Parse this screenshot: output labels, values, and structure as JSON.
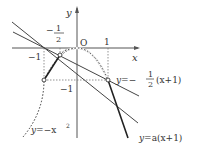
{
  "diagram": {
    "axes": {
      "x_label": "x",
      "y_label": "y",
      "origin_label": "O"
    },
    "ticks": {
      "x_neg_one": "−1",
      "x_neg_half_num": "1",
      "x_neg_half_den": "2",
      "x_neg_half_sign": "−",
      "x_one": "1",
      "y_neg_one": "−1"
    },
    "curves": [
      {
        "name": "parabola",
        "equation": "y=−x²",
        "style": "dotted"
      },
      {
        "name": "line_half",
        "equation": "y=−½(x+1)",
        "style": "solid"
      },
      {
        "name": "line_a",
        "equation": "y=a(x+1)",
        "style": "solid"
      },
      {
        "name": "graph_f",
        "style": "bold solid",
        "description": "piecewise graph through (−1,−1), (−1/2,−1/4), (1,−1)"
      }
    ],
    "labels": {
      "parabola_y": "y",
      "parabola_eq": "=−x",
      "parabola_sup": "2",
      "half_line_y": "y",
      "half_line_eq": "=−",
      "half_line_num": "1",
      "half_line_den": "2",
      "half_line_tail": "(x+1)",
      "a_line_y": "y",
      "a_line_eq": "=a(x+1)"
    },
    "points": [
      {
        "x": -1,
        "y": -1
      },
      {
        "x": -0.5,
        "y": -0.25
      },
      {
        "x": 1,
        "y": -1
      }
    ]
  }
}
